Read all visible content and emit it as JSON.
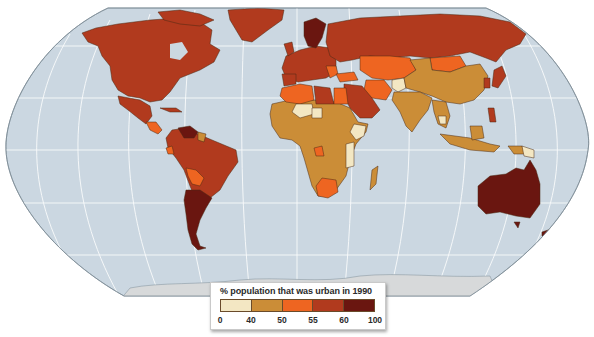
{
  "map": {
    "title": "% population that was urban in 1990",
    "projection": "Robinson-like world map",
    "colors": {
      "ocean": "#cbd8e1",
      "antarctica": "#d7d9da",
      "graticule": "#ffffff",
      "border": "#4a2a14"
    },
    "classes": [
      {
        "range": "0-40",
        "color": "#f3e7c3"
      },
      {
        "range": "40-50",
        "color": "#cb8d37"
      },
      {
        "range": "50-55",
        "color": "#ee6521"
      },
      {
        "range": "55-60",
        "color": "#b13a1e"
      },
      {
        "range": "60-100",
        "color": "#6a1610"
      }
    ],
    "regions": [
      {
        "name": "Canada/USA/Alaska",
        "class": "55-60"
      },
      {
        "name": "Greenland",
        "class": "55-60"
      },
      {
        "name": "Mexico",
        "class": "55-60"
      },
      {
        "name": "Central America",
        "class": "50-55"
      },
      {
        "name": "Venezuela",
        "class": "60-100"
      },
      {
        "name": "Guyana/Suriname",
        "class": "40-50"
      },
      {
        "name": "Brazil",
        "class": "55-60"
      },
      {
        "name": "Colombia/Peru",
        "class": "55-60"
      },
      {
        "name": "Bolivia/Paraguay",
        "class": "50-55"
      },
      {
        "name": "Argentina/Chile/Uruguay",
        "class": "60-100"
      },
      {
        "name": "Europe",
        "class": "55-60"
      },
      {
        "name": "Scandinavia",
        "class": "60-100"
      },
      {
        "name": "Russia",
        "class": "55-60"
      },
      {
        "name": "Central Asia",
        "class": "50-55"
      },
      {
        "name": "Mongolia",
        "class": "50-55"
      },
      {
        "name": "Turkey/Iran",
        "class": "50-55"
      },
      {
        "name": "Arabian Peninsula",
        "class": "55-60"
      },
      {
        "name": "Afghanistan",
        "class": "0-40"
      },
      {
        "name": "China",
        "class": "40-50"
      },
      {
        "name": "India",
        "class": "40-50"
      },
      {
        "name": "Southeast Asia",
        "class": "40-50"
      },
      {
        "name": "Japan/Korea",
        "class": "55-60"
      },
      {
        "name": "Indonesia",
        "class": "40-50"
      },
      {
        "name": "Papua New Guinea",
        "class": "0-40"
      },
      {
        "name": "Australia",
        "class": "60-100"
      },
      {
        "name": "New Zealand",
        "class": "60-100"
      },
      {
        "name": "North Africa (Algeria/Egypt)",
        "class": "50-55"
      },
      {
        "name": "Libya",
        "class": "55-60"
      },
      {
        "name": "Sahel (Mali/Niger/Chad)",
        "class": "0-40"
      },
      {
        "name": "Sub-Saharan Africa",
        "class": "40-50"
      },
      {
        "name": "Ethiopia/East Africa",
        "class": "0-40"
      },
      {
        "name": "Congo (Rep.)",
        "class": "50-55"
      },
      {
        "name": "Southern Africa",
        "class": "50-55"
      },
      {
        "name": "Madagascar",
        "class": "40-50"
      }
    ]
  },
  "legend": {
    "title": "% population that was urban in 1990",
    "ticks": [
      "0",
      "40",
      "50",
      "55",
      "60",
      "100"
    ],
    "swatches": [
      "#f3e7c3",
      "#cb8d37",
      "#ee6521",
      "#b13a1e",
      "#6a1610"
    ]
  }
}
